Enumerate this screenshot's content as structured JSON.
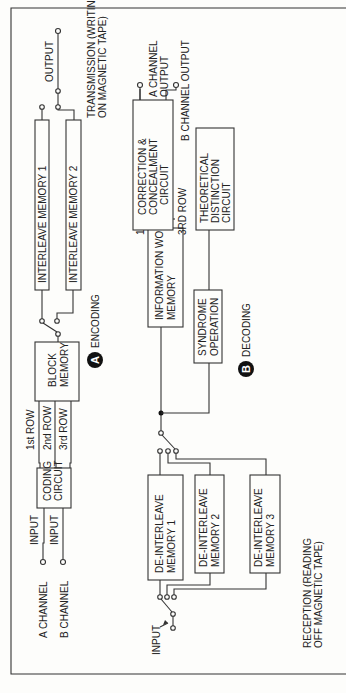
{
  "diagram": {
    "colors": {
      "ink": "#333333",
      "background": "#fdfdfb"
    },
    "orientation": "rotated 90 degrees counter-clockwise",
    "encoding": {
      "badge": "A",
      "title": "ENCODING",
      "inputs": [
        {
          "channel": "A CHANNEL",
          "label": "INPUT"
        },
        {
          "channel": "B CHANNEL",
          "label": "INPUT"
        }
      ],
      "coding_circuit": [
        "CODING",
        "CIRCUIT"
      ],
      "rows": [
        "1st ROW",
        "2nd ROW",
        "3rd ROW"
      ],
      "block_memory": [
        "BLOCK",
        "MEMORY"
      ],
      "interleave_memory_1": "INTERLEAVE MEMORY 1",
      "interleave_memory_2": "INTERLEAVE MEMORY 2",
      "output_label": "OUTPUT",
      "transmission": [
        "TRANSMISSION (WRITING",
        "ON MAGNETIC TAPE)"
      ]
    },
    "decoding": {
      "badge": "B",
      "title": "DECODING",
      "input_label": "INPUT",
      "reception": [
        "RECEPTION (READING",
        "OFF MAGNETIC TAPE)"
      ],
      "deinterleave_1": [
        "DE-INTERLEAVE",
        "MEMORY 1"
      ],
      "deinterleave_2": [
        "DE-INTERLEAVE",
        "MEMORY 2"
      ],
      "deinterleave_3": [
        "DE-INTERLEAVE",
        "MEMORY 3"
      ],
      "information_word_memory": [
        "INFORMATION WORD",
        "MEMORY"
      ],
      "syndrome_operation": [
        "SYNDROME",
        "OPERATION"
      ],
      "rows": [
        "1ST ROW",
        "3RD ROW"
      ],
      "correction_circuit": [
        "CORRECTION &",
        "CONCEALMENT",
        "CIRCUIT"
      ],
      "theoretical_circuit": [
        "THEORETICAL",
        "DISTINCTION",
        "CIRCUIT"
      ],
      "a_channel_output": [
        "A CHANNEL",
        "OUTPUT"
      ],
      "b_channel_output": "B CHANNEL OUTPUT"
    }
  }
}
